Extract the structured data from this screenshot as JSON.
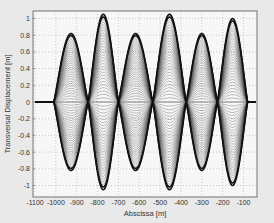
{
  "chart_data": {
    "type": "line",
    "title": "",
    "xlabel": "Abscissa [m]",
    "ylabel": "Transversal Displacement [m]",
    "xlim": [
      -1100,
      -25
    ],
    "ylim": [
      -1.05,
      1.08
    ],
    "xticks": [
      -1100,
      -1000,
      -900,
      -800,
      -700,
      -600,
      -500,
      -400,
      -300,
      -200,
      -100
    ],
    "yticks": [
      -1,
      -0.8,
      -0.6,
      -0.4,
      -0.2,
      0,
      0.2,
      0.4,
      0.6,
      0.8,
      1
    ],
    "xtick_labels": [
      "-1100",
      "-1000",
      "-900",
      "-800",
      "-700",
      "-600",
      "-500",
      "-400",
      "-300",
      "-200",
      "-100"
    ],
    "ytick_labels": [
      "-1",
      "-0.8",
      "-0.6",
      "-0.4",
      "-0.2",
      "0",
      "0.2",
      "0.4",
      "0.6",
      "0.8",
      "1"
    ],
    "grid": true,
    "legend": null,
    "nodes_x": [
      -1010,
      -845,
      -700,
      -535,
      -375,
      -225,
      -80
    ],
    "lobes": [
      {
        "center_x": -928,
        "max_amplitude": 0.82
      },
      {
        "center_x": -772,
        "max_amplitude": 1.05
      },
      {
        "center_x": -618,
        "max_amplitude": 0.82
      },
      {
        "center_x": -455,
        "max_amplitude": 1.05
      },
      {
        "center_x": -300,
        "max_amplitude": 0.82
      },
      {
        "center_x": -152,
        "max_amplitude": 1.0
      }
    ],
    "series_count": 30,
    "series": [
      {
        "name": "envelope",
        "values_note": "Outer thick curve: +/- max_amplitude at each lobe center, zero at nodes"
      }
    ]
  },
  "colors": {
    "background": "#e9e9e9",
    "plot_background": "#f7f7f7",
    "curves": "#222222",
    "grid": "#9a9a9a",
    "frame": "#555555"
  }
}
